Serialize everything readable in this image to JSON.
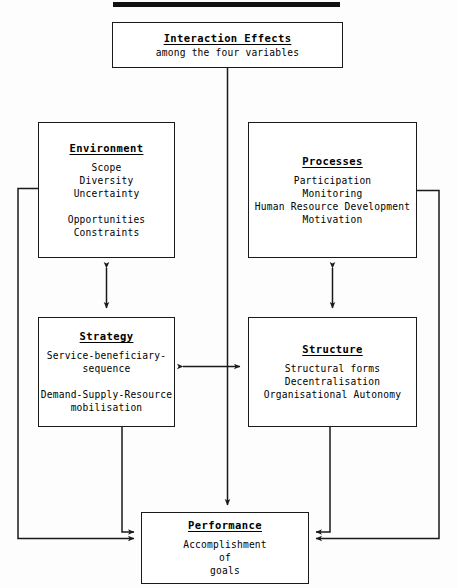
{
  "diagram": {
    "title_bar": "",
    "nodes": {
      "interaction": {
        "title": "Interaction Effects",
        "lines": [
          "among the four variables"
        ],
        "lines2": []
      },
      "environment": {
        "title": "Environment",
        "lines": [
          "Scope",
          "Diversity",
          "Uncertainty"
        ],
        "lines2": [
          "Opportunities",
          "Constraints"
        ]
      },
      "processes": {
        "title": "Processes",
        "lines": [
          "Participation",
          "Monitoring",
          "Human Resource Development",
          "Motivation"
        ],
        "lines2": []
      },
      "strategy": {
        "title": "Strategy",
        "lines": [
          "Service-beneficiary-",
          "sequence"
        ],
        "lines2": [
          "Demand-Supply-Resource",
          "mobilisation"
        ]
      },
      "structure": {
        "title": "Structure",
        "lines": [
          "Structural forms",
          "Decentralisation",
          "Organisational Autonomy"
        ],
        "lines2": []
      },
      "performance": {
        "title": "Performance",
        "lines": [
          "Accomplishment",
          "of",
          "goals"
        ],
        "lines2": []
      }
    },
    "connectors": [
      {
        "name": "interaction-to-performance",
        "type": "arrow-down"
      },
      {
        "name": "environment-to-strategy",
        "type": "double-arrow-vertical"
      },
      {
        "name": "processes-to-structure",
        "type": "double-arrow-vertical"
      },
      {
        "name": "strategy-to-structure",
        "type": "double-arrow-horizontal"
      },
      {
        "name": "strategy-to-performance",
        "type": "arrow-right"
      },
      {
        "name": "structure-to-performance",
        "type": "arrow-left"
      },
      {
        "name": "environment-to-performance",
        "type": "arrow-right-rail"
      },
      {
        "name": "processes-to-performance",
        "type": "arrow-left-rail"
      }
    ],
    "colors": {
      "stroke": "#1a1a1a",
      "background": "#ffffff",
      "text": "#000000"
    }
  }
}
